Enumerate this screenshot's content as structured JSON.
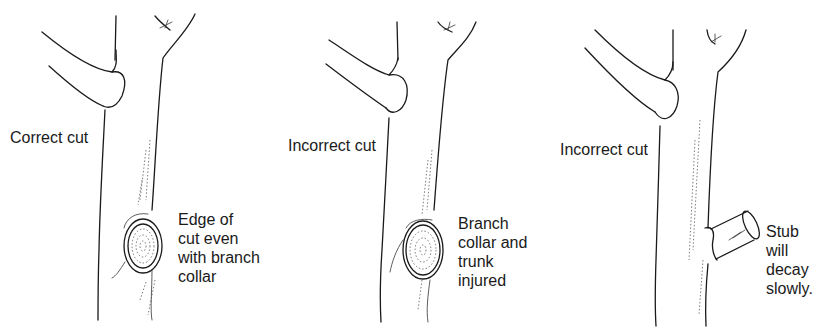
{
  "figure": {
    "panels": [
      {
        "id": "correct-cut",
        "title": "Correct cut",
        "caption": "Edge of\ncut even\nwith branch\ncollar"
      },
      {
        "id": "incorrect-cut-flush",
        "title": "Incorrect cut",
        "caption": "Branch\ncollar and\ntrunk\ninjured"
      },
      {
        "id": "incorrect-cut-stub",
        "title": "Incorrect cut",
        "caption": "Stub\nwill\ndecay\nslowly."
      }
    ]
  }
}
